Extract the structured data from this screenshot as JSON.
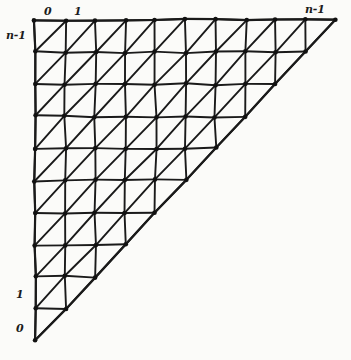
{
  "figure": {
    "kind": "hand-drawn-triangular-mesh",
    "background_color": "#fbfbf9",
    "line_color": "#1a1a1a",
    "vertex_color": "#111111"
  },
  "labels": {
    "top_origin": "0",
    "top_first": "1",
    "top_last": "n-1",
    "left_top": "n-1",
    "left_first": "1",
    "left_origin": "0"
  },
  "geometry": {
    "cells_per_side": 10,
    "vertices_per_side": 11,
    "cell_width": 30.1,
    "cell_height": 32.1,
    "origin_x": 35,
    "origin_y": 20,
    "right_x": 336,
    "bottom_y": 341,
    "diagonal_direction": "bottom-left-to-top-right",
    "triangle_orientation": "upper-left",
    "hypotenuse_from": "bottom-left",
    "hypotenuse_to": "top-right"
  }
}
